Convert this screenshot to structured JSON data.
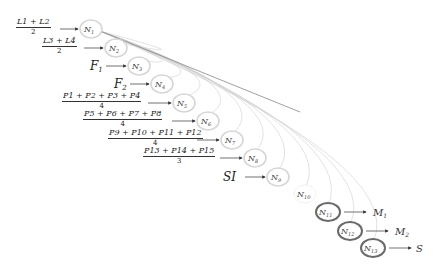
{
  "diagram": {
    "nodes": [
      {
        "id": "N1",
        "label": "N1",
        "sub": "1",
        "x": 91,
        "y": 29,
        "emphasis": false
      },
      {
        "id": "N2",
        "label": "N2",
        "sub": "2",
        "x": 116,
        "y": 48,
        "emphasis": false
      },
      {
        "id": "N3",
        "label": "N3",
        "sub": "3",
        "x": 139,
        "y": 66,
        "emphasis": false
      },
      {
        "id": "N4",
        "label": "N4",
        "sub": "4",
        "x": 162,
        "y": 84,
        "emphasis": false
      },
      {
        "id": "N5",
        "label": "N5",
        "sub": "5",
        "x": 184,
        "y": 103,
        "emphasis": false
      },
      {
        "id": "N6",
        "label": "N6",
        "sub": "6",
        "x": 208,
        "y": 121,
        "emphasis": false
      },
      {
        "id": "N7",
        "label": "N7",
        "sub": "7",
        "x": 232,
        "y": 140,
        "emphasis": false
      },
      {
        "id": "N8",
        "label": "N8",
        "sub": "8",
        "x": 255,
        "y": 158,
        "emphasis": false
      },
      {
        "id": "N9",
        "label": "N9",
        "sub": "9",
        "x": 278,
        "y": 177,
        "emphasis": false
      },
      {
        "id": "N10",
        "label": "N10",
        "sub": "10",
        "x": 305,
        "y": 194,
        "emphasis": false,
        "no_circle": true
      },
      {
        "id": "N11",
        "label": "N11",
        "sub": "11",
        "x": 328,
        "y": 212,
        "emphasis": true
      },
      {
        "id": "N12",
        "label": "N12",
        "sub": "12",
        "x": 350,
        "y": 231,
        "emphasis": true
      },
      {
        "id": "N13",
        "label": "N13",
        "sub": "13",
        "x": 373,
        "y": 248,
        "emphasis": true
      }
    ],
    "inputs": [
      {
        "target": "N1",
        "type": "fraction",
        "numerator": "L1 + L2",
        "denominator": "2"
      },
      {
        "target": "N2",
        "type": "fraction",
        "numerator": "L3 + L4",
        "denominator": "2"
      },
      {
        "target": "N3",
        "type": "text",
        "text": "F1"
      },
      {
        "target": "N4",
        "type": "text",
        "text": "F2"
      },
      {
        "target": "N5",
        "type": "fraction",
        "numerator": "P1 + P2 + P3 + P4",
        "denominator": "4"
      },
      {
        "target": "N6",
        "type": "fraction",
        "numerator": "P5 + P6 + P7 + P8",
        "denominator": "4"
      },
      {
        "target": "N7",
        "type": "fraction",
        "numerator": "P9 + P10 + P11 + P12",
        "denominator": "4"
      },
      {
        "target": "N8",
        "type": "fraction",
        "numerator": "P13 + P14 + P15",
        "denominator": "3"
      },
      {
        "target": "N9",
        "type": "text",
        "text": "SI"
      }
    ],
    "outputs": [
      {
        "source": "N11",
        "text": "M1"
      },
      {
        "source": "N12",
        "text": "M2"
      },
      {
        "source": "N13",
        "text": "S"
      }
    ],
    "colors": {
      "node_light": "#d6d6d6",
      "node_dark": "#6a6a6a",
      "arc": "#c8c8c8",
      "text": "#222222"
    }
  }
}
